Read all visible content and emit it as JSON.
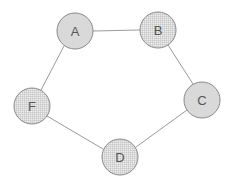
{
  "diagram": {
    "type": "graph",
    "nodes": [
      {
        "id": "A",
        "label": "A",
        "x": 75,
        "y": 31,
        "fill": "solid"
      },
      {
        "id": "B",
        "label": "B",
        "x": 158,
        "y": 30,
        "fill": "grid"
      },
      {
        "id": "C",
        "label": "C",
        "x": 202,
        "y": 100,
        "fill": "solid"
      },
      {
        "id": "D",
        "label": "D",
        "x": 120,
        "y": 157,
        "fill": "grid"
      },
      {
        "id": "F",
        "label": "F",
        "x": 32,
        "y": 106,
        "fill": "grid"
      }
    ],
    "edges": [
      {
        "from": "A",
        "to": "B"
      },
      {
        "from": "B",
        "to": "C"
      },
      {
        "from": "C",
        "to": "D"
      },
      {
        "from": "D",
        "to": "F"
      },
      {
        "from": "F",
        "to": "A"
      }
    ],
    "colors": {
      "node_fill": "#d9d9d9",
      "node_stroke": "#8a8a8a",
      "edge": "#9a9a9a",
      "grid_line": "#b5b5b5",
      "label": "#555555"
    }
  }
}
